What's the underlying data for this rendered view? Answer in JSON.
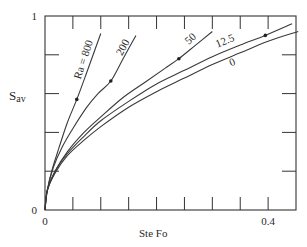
{
  "chart_data": {
    "type": "line",
    "title": "",
    "xlabel": "Ste Fo",
    "ylabel": "S",
    "ylabel_sub": "av",
    "xlim": [
      0,
      0.45
    ],
    "ylim": [
      0,
      1
    ],
    "x_ticks": [
      0,
      0.05,
      0.1,
      0.15,
      0.2,
      0.25,
      0.3,
      0.35,
      0.4
    ],
    "x_tick_labels": [
      {
        "value": 0,
        "label": "0"
      },
      {
        "value": 0.4,
        "label": "0.4"
      }
    ],
    "y_ticks": [
      0,
      0.2,
      0.4,
      0.6,
      0.8,
      1.0
    ],
    "y_tick_labels": [
      {
        "value": 0,
        "label": "0"
      },
      {
        "value": 1,
        "label": "1"
      }
    ],
    "grid": false,
    "legend": "inline curve labels",
    "series": [
      {
        "name": "Ra = 800",
        "label": "Ra = 800",
        "x": [
          0,
          0.004,
          0.012,
          0.025,
          0.04,
          0.057,
          0.075,
          0.09,
          0.1
        ],
        "y": [
          0,
          0.1,
          0.2,
          0.32,
          0.45,
          0.57,
          0.71,
          0.83,
          0.91
        ],
        "marker": {
          "x": 0.057,
          "y": 0.57
        },
        "label_pos": {
          "x": 0.075,
          "y": 0.77,
          "angle": -72
        }
      },
      {
        "name": "Ra = 200",
        "label": "200",
        "x": [
          0,
          0.004,
          0.015,
          0.03,
          0.05,
          0.075,
          0.095,
          0.118,
          0.14,
          0.163
        ],
        "y": [
          0,
          0.1,
          0.22,
          0.32,
          0.42,
          0.53,
          0.6,
          0.665,
          0.78,
          0.9
        ],
        "marker": {
          "x": 0.118,
          "y": 0.665
        },
        "label_pos": {
          "x": 0.145,
          "y": 0.83,
          "angle": -62
        }
      },
      {
        "name": "Ra = 50",
        "label": "50",
        "x": [
          0,
          0.004,
          0.018,
          0.04,
          0.07,
          0.1,
          0.14,
          0.18,
          0.215,
          0.24,
          0.27,
          0.3
        ],
        "y": [
          0,
          0.1,
          0.2,
          0.3,
          0.4,
          0.48,
          0.58,
          0.66,
          0.73,
          0.78,
          0.85,
          0.92
        ],
        "marker": {
          "x": 0.24,
          "y": 0.78
        },
        "label_pos": {
          "x": 0.265,
          "y": 0.87,
          "angle": -42
        }
      },
      {
        "name": "Ra = 12.5",
        "label": "12.5",
        "x": [
          0,
          0.004,
          0.018,
          0.04,
          0.07,
          0.1,
          0.15,
          0.2,
          0.25,
          0.3,
          0.35,
          0.395,
          0.443
        ],
        "y": [
          0,
          0.1,
          0.2,
          0.29,
          0.38,
          0.46,
          0.56,
          0.65,
          0.72,
          0.79,
          0.85,
          0.9,
          0.96
        ],
        "marker": {
          "x": 0.395,
          "y": 0.9
        },
        "label_pos": {
          "x": 0.325,
          "y": 0.855,
          "angle": -22
        }
      },
      {
        "name": "Ra = 0",
        "label": "0",
        "x": [
          0,
          0.004,
          0.018,
          0.04,
          0.07,
          0.1,
          0.15,
          0.2,
          0.25,
          0.3,
          0.35,
          0.4,
          0.454
        ],
        "y": [
          0,
          0.1,
          0.19,
          0.28,
          0.36,
          0.43,
          0.53,
          0.61,
          0.68,
          0.75,
          0.81,
          0.87,
          0.92
        ],
        "marker": null,
        "label_pos": {
          "x": 0.338,
          "y": 0.745,
          "angle": -22
        }
      }
    ]
  }
}
